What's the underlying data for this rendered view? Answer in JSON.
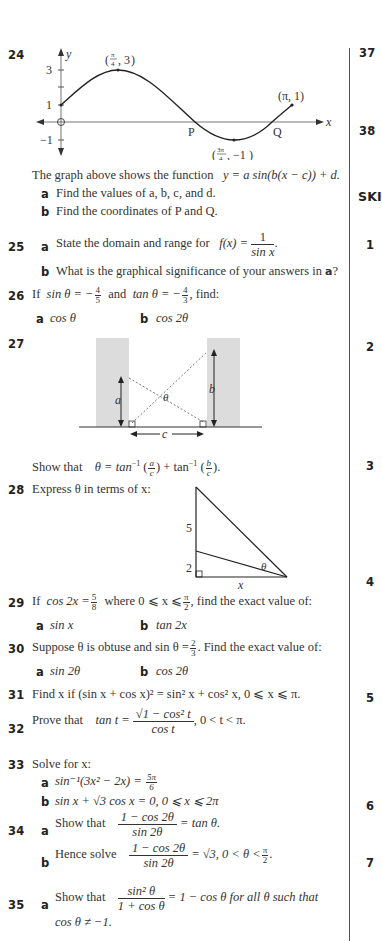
{
  "page": {
    "background": "#ffffff",
    "text_color": "#333333",
    "divider_color": "#555555",
    "shade_color": "#dcdcdc"
  },
  "right_column": {
    "numbers": [
      "37",
      "38",
      "1",
      "2",
      "3",
      "4",
      "5",
      "6",
      "7"
    ],
    "heading_fragment": "SKI"
  },
  "problems": {
    "p24": {
      "number": "24",
      "graph": {
        "x_axis_label": "x",
        "y_axis_label": "y",
        "y_ticks": [
          "3",
          "1",
          "−1"
        ],
        "points": {
          "max": "(π/4, 3)",
          "min": "(3π/4, −1)",
          "end": "(π, 1)",
          "P": "P",
          "Q": "Q"
        },
        "max_label_num": "π",
        "max_label_den": "4",
        "max_label_val": "3",
        "min_label_num": "3π",
        "min_label_den": "4",
        "min_label_val": "−1",
        "end_label": "(π, 1)"
      },
      "text": "The graph above shows the function",
      "function": "y = a sin(b(x − c)) + d.",
      "parts": [
        {
          "label": "a",
          "text": "Find the values of a, b, c, and d."
        },
        {
          "label": "b",
          "text": "Find the coordinates of P and Q."
        }
      ]
    },
    "p25": {
      "number": "25",
      "parts": [
        {
          "label": "a",
          "text": "State the domain and range for",
          "expr_lhs": "f(x) =",
          "expr_num": "1",
          "expr_den": "sin x",
          "tail": "."
        },
        {
          "label": "b",
          "text": "What is the graphical significance of your answers in",
          "ref": "a",
          "tail": "?"
        }
      ]
    },
    "p26": {
      "number": "26",
      "text_if": "If",
      "sin_expr": "sin θ = −",
      "sin_num": "4",
      "sin_den": "5",
      "and": "and",
      "tan_expr": "tan θ = −",
      "tan_num": "4",
      "tan_den": "3",
      "find": ",  find:",
      "parts": [
        {
          "label": "a",
          "text": "cos θ"
        },
        {
          "label": "b",
          "text": "cos 2θ"
        }
      ]
    },
    "p27": {
      "number": "27",
      "diagram_labels": {
        "a": "a",
        "b": "b",
        "c": "c",
        "theta": "θ"
      },
      "text": "Show that",
      "expr": "θ = tan⁻¹ (a/c) + tan⁻¹ (b/c).",
      "expr_lhs": "θ = tan",
      "inv": "−1",
      "a_num": "a",
      "b_num": "b",
      "den": "c",
      "plus": "+ tan"
    },
    "p28": {
      "number": "28",
      "text": "Express θ in terms of x:",
      "diagram_labels": {
        "upper": "5",
        "lower": "2",
        "base": "x",
        "angle": "θ"
      }
    },
    "p29": {
      "number": "29",
      "text_if": "If",
      "expr": "cos 2x =",
      "num": "5",
      "den": "8",
      "where": "where  0 ⩽ x ⩽",
      "pi_num": "π",
      "pi_den": "2",
      "tail": ",  find the exact value of:",
      "parts": [
        {
          "label": "a",
          "text": "sin x"
        },
        {
          "label": "b",
          "text": "tan 2x"
        }
      ]
    },
    "p30": {
      "number": "30",
      "text": "Suppose θ is obtuse and  sin θ =",
      "num": "2",
      "den": "3",
      "tail": ".   Find the exact value of:",
      "parts": [
        {
          "label": "a",
          "text": "sin 2θ"
        },
        {
          "label": "b",
          "text": "cos 2θ"
        }
      ]
    },
    "p31": {
      "number": "31",
      "text": "Find x if   (sin x + cos x)² = sin² x + cos² x,   0 ⩽ x ⩽ π."
    },
    "p32": {
      "number": "32",
      "text": "Prove that",
      "lhs": "tan t =",
      "num": "√1 − cos² t",
      "den": "cos t",
      "tail": ",   0 < t < π."
    },
    "p33": {
      "number": "33",
      "text": "Solve for x:",
      "parts": [
        {
          "label": "a",
          "text": "sin⁻¹(3x² − 2x) =",
          "num": "5π",
          "den": "6"
        },
        {
          "label": "b",
          "text": "sin x + √3 cos x = 0,   0 ⩽ x ⩽ 2π"
        }
      ]
    },
    "p34": {
      "number": "34",
      "parts": [
        {
          "label": "a",
          "text": "Show that",
          "num": "1 − cos 2θ",
          "den": "sin 2θ",
          "tail": "= tan θ."
        },
        {
          "label": "b",
          "text": "Hence solve",
          "num": "1 − cos 2θ",
          "den": "sin 2θ",
          "tail": "= √3,   0 < θ <",
          "pi_num": "π",
          "pi_den": "2",
          "end": "."
        }
      ]
    },
    "p35": {
      "number": "35",
      "parts": [
        {
          "label": "a",
          "text": "Show that",
          "num": "sin² θ",
          "den": "1 + cos θ",
          "tail": "= 1 − cos θ   for all θ such that",
          "line2": "cos θ ≠ −1."
        }
      ]
    }
  }
}
